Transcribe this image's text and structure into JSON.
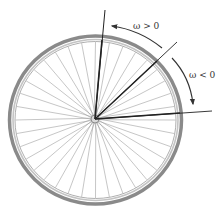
{
  "figure": {
    "spoke_count": 36,
    "colors": {
      "tire": "#8a8a8a",
      "rim": "#b8b8b8",
      "spokes": "#a0a0a0",
      "reference_lines": "#222222",
      "arrows": "#333333"
    }
  },
  "labels": {
    "positive": "ω > 0",
    "negative": "ω < 0"
  }
}
